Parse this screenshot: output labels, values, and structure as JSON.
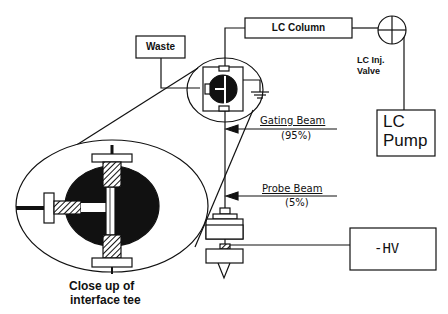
{
  "diagram": {
    "components": {
      "waste": "Waste",
      "lc_column": "LC Column",
      "lc_inj_valve_line1": "LC Inj.",
      "lc_inj_valve_line2": "Valve",
      "lc_pump_line1": "LC",
      "lc_pump_line2": "Pump",
      "high_voltage": "-HV"
    },
    "beams": {
      "gating": {
        "label": "Gating   Beam",
        "percent": "(95%)"
      },
      "probe": {
        "label": "Probe   Beam",
        "percent": "(5%)"
      }
    },
    "inset": {
      "caption_line1": "Close up of",
      "caption_line2": "interface tee"
    },
    "colors": {
      "line": "#111111",
      "background": "#ffffff"
    }
  }
}
